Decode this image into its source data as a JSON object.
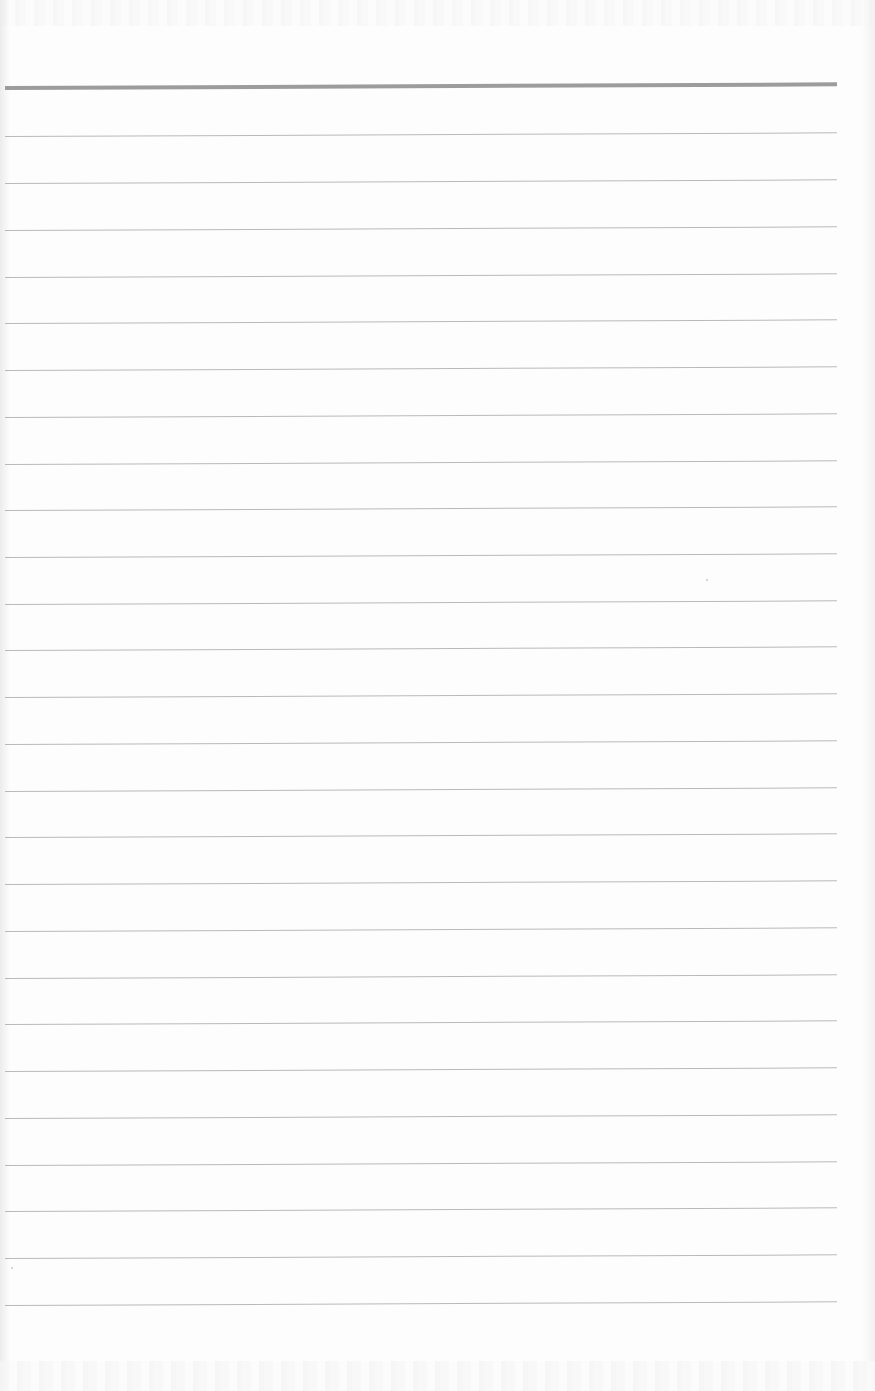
{
  "page": {
    "type": "blank-lined-paper",
    "background_color": "#fdfdfd",
    "header_rule": {
      "y": 86,
      "thickness": 4,
      "color": "#9c9c9c",
      "x_start": 5,
      "x_end": 837
    },
    "rules": {
      "count": 26,
      "color": "#b9b9b9",
      "thickness": 1,
      "x_start": 5,
      "x_end": 837,
      "y_positions": [
        136,
        183,
        230,
        277,
        323,
        370,
        417,
        464,
        510,
        557,
        604,
        650,
        697,
        744,
        791,
        837,
        884,
        931,
        978,
        1024,
        1071,
        1118,
        1165,
        1211,
        1258,
        1305
      ]
    },
    "text_content": []
  }
}
